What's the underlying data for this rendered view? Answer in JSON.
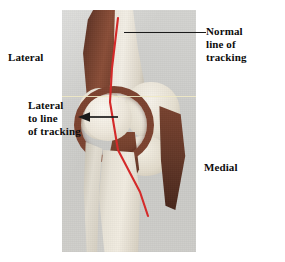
{
  "figure": {
    "type": "anatomical-photo-diagram",
    "background_color": "#ffffff",
    "photo": {
      "background_color": "#cdcdcb",
      "left": 62,
      "top": 10,
      "width": 134,
      "height": 242
    }
  },
  "labels": {
    "lateral_top": "Lateral",
    "lateral_to_line": "Lateral\nto line\nof tracking",
    "medial": "Medial",
    "normal_line": "Normal\nline of\ntracking"
  },
  "annotations": {
    "tracking_line": {
      "name": "normal-line-of-tracking",
      "color": "#d42a2a",
      "description": "red line from femoral shaft down through patella region to tibia",
      "points": [
        [
          56,
          8
        ],
        [
          50,
          58
        ],
        [
          48,
          92
        ],
        [
          56,
          140
        ],
        [
          78,
          182
        ],
        [
          86,
          206
        ]
      ]
    },
    "joint_line": {
      "name": "joint-line",
      "color": "#efe9c4",
      "orientation": "horizontal",
      "y": 86
    },
    "leader_normal": {
      "color": "#1a1a1a",
      "from_x": 124,
      "to_x": 206,
      "y": 32
    },
    "arrow_lateral": {
      "color": "#1a1a1a",
      "direction": "left",
      "from_x": 118,
      "to_x": 80,
      "y": 117
    }
  },
  "anatomy": {
    "parts": [
      {
        "name": "femur",
        "color": "#ece7dd"
      },
      {
        "name": "vastus-lateralis-muscle",
        "color": "#73402e"
      },
      {
        "name": "lateral-femoral-condyle",
        "color": "#e3dccd"
      },
      {
        "name": "medial-femoral-condyle",
        "color": "#e6e0d1"
      },
      {
        "name": "patellar-retinaculum",
        "color": "#7c4330"
      },
      {
        "name": "patella",
        "color": "#eee8dc"
      },
      {
        "name": "patellar-tendon",
        "color": "#693a29"
      },
      {
        "name": "medial-soft-tissue",
        "color": "#633828"
      },
      {
        "name": "tibial-plateau",
        "color": "#e2dbcb"
      },
      {
        "name": "tibia",
        "color": "#e9e4d8"
      },
      {
        "name": "fibula",
        "color": "#e3ded2"
      }
    ]
  }
}
